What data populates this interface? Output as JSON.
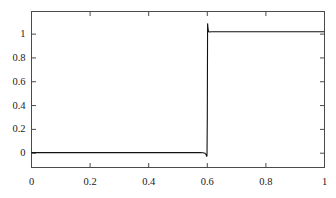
{
  "chart_data": {
    "type": "line",
    "title": "",
    "subtitle": "",
    "xlabel": "",
    "ylabel": "",
    "xlim": [
      0,
      1
    ],
    "ylim": [
      -0.12,
      1.19
    ],
    "grid": false,
    "legend": null,
    "frame": "box",
    "tick_direction": "in",
    "line_color": "#111111",
    "line_width": 1.1,
    "xticks": [
      0,
      0.2,
      0.4,
      0.6,
      0.8,
      1
    ],
    "xticklabels": [
      "0",
      "0.2",
      "0.4",
      "0.6",
      "0.8",
      "1"
    ],
    "yticks": [
      0,
      0.2,
      0.4,
      0.6,
      0.8,
      1
    ],
    "yticklabels": [
      "0",
      "0.2",
      "0.4",
      "0.6",
      "0.8",
      "1"
    ],
    "series": [
      {
        "name": "step solution",
        "x": [
          0.0,
          0.02,
          0.04,
          0.06,
          0.08,
          0.1,
          0.12,
          0.14,
          0.16,
          0.18,
          0.2,
          0.22,
          0.24,
          0.26,
          0.28,
          0.3,
          0.32,
          0.34,
          0.36,
          0.38,
          0.4,
          0.42,
          0.44,
          0.46,
          0.48,
          0.5,
          0.52,
          0.54,
          0.56,
          0.575,
          0.585,
          0.592,
          0.596,
          0.598,
          0.599,
          0.6,
          0.601,
          0.602,
          0.604,
          0.608,
          0.614,
          0.622,
          0.635,
          0.65,
          0.68,
          0.7,
          0.74,
          0.78,
          0.82,
          0.86,
          0.9,
          0.94,
          0.97,
          1.0
        ],
        "y": [
          0.005,
          0.005,
          0.005,
          0.005,
          0.005,
          0.005,
          0.005,
          0.005,
          0.005,
          0.005,
          0.005,
          0.005,
          0.005,
          0.005,
          0.005,
          0.005,
          0.005,
          0.005,
          0.005,
          0.005,
          0.005,
          0.005,
          0.005,
          0.005,
          0.005,
          0.005,
          0.005,
          0.005,
          0.005,
          0.005,
          0.004,
          0.0,
          -0.012,
          -0.028,
          -0.015,
          0.3,
          1.09,
          1.06,
          1.022,
          1.018,
          1.02,
          1.02,
          1.02,
          1.02,
          1.02,
          1.02,
          1.02,
          1.02,
          1.02,
          1.02,
          1.02,
          1.02,
          1.02,
          1.02
        ]
      }
    ],
    "annotations": [
      {
        "name": "jump-location",
        "x": 0.6,
        "text": ""
      },
      {
        "name": "left-state",
        "value": 0.0
      },
      {
        "name": "right-state",
        "value": 1.02
      }
    ]
  }
}
